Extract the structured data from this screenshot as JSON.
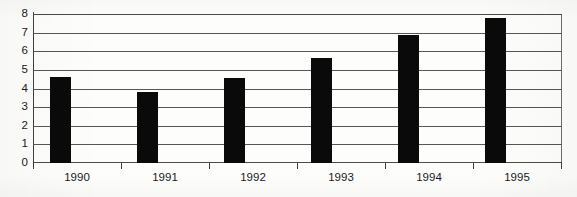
{
  "chart_data": {
    "type": "bar",
    "title": "",
    "subtitle": "",
    "xlabel": "",
    "ylabel": "",
    "categories": [
      "1990",
      "1991",
      "1992",
      "1993",
      "1994",
      "1995"
    ],
    "values": [
      4.6,
      3.8,
      4.55,
      5.65,
      6.85,
      7.8
    ],
    "ylim": [
      0,
      8
    ],
    "ytick_labels": [
      "0",
      "1",
      "2",
      "3",
      "4",
      "5",
      "6",
      "7",
      "8"
    ],
    "ytick_values": [
      0,
      1,
      2,
      3,
      4,
      5,
      6,
      7,
      8
    ],
    "grid": true,
    "grid_axis": "y",
    "legend": false,
    "legend_position": "none",
    "annotations": [],
    "series": [
      {
        "name": "",
        "values": [
          4.6,
          3.8,
          4.55,
          5.65,
          6.85,
          7.8
        ],
        "color": "#0a0a0a"
      }
    ]
  },
  "style": {
    "bar_color": "#0a0a0a",
    "gridline_color": "#55565a",
    "axis_color": "#3f4044",
    "text_color": "#1b1b1b",
    "background_color": "#fdfdfc"
  }
}
